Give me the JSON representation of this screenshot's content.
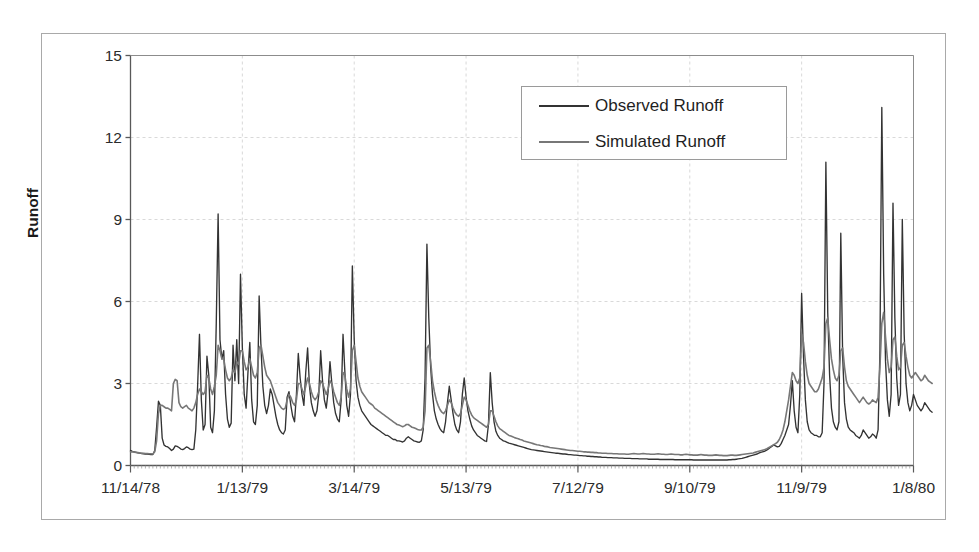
{
  "chart_data": {
    "type": "line",
    "title": "",
    "xlabel": "",
    "ylabel": "Runoff",
    "ylim": [
      0,
      15
    ],
    "yticks": [
      0,
      3,
      6,
      9,
      12,
      15
    ],
    "ytick_labels": [
      "0",
      "3",
      "6",
      "9",
      "12",
      "15"
    ],
    "xtick_labels": [
      "11/14/78",
      "1/13/79",
      "3/14/79",
      "5/13/79",
      "7/12/79",
      "9/10/79",
      "11/9/79",
      "1/8/80"
    ],
    "x_start_date": "11/14/78",
    "x_end_date": "1/8/80",
    "x_index_range": [
      0,
      420
    ],
    "xtick_indices": [
      0,
      60,
      120,
      180,
      240,
      300,
      360,
      420
    ],
    "grid": true,
    "grid_color": "#d9d9d9",
    "legend_position": "top-right",
    "legend": [
      "Observed Runoff",
      "Simulated Runoff"
    ],
    "series": [
      {
        "name": "Observed Runoff",
        "color": "#333333",
        "values": [
          0.55,
          0.52,
          0.5,
          0.48,
          0.46,
          0.45,
          0.44,
          0.43,
          0.42,
          0.42,
          0.41,
          0.4,
          0.4,
          0.55,
          1.4,
          2.35,
          2.2,
          1.0,
          0.75,
          0.7,
          0.68,
          0.62,
          0.55,
          0.6,
          0.72,
          0.7,
          0.66,
          0.6,
          0.58,
          0.62,
          0.68,
          0.65,
          0.6,
          0.58,
          0.6,
          1.3,
          2.9,
          4.8,
          2.4,
          1.3,
          1.5,
          4.0,
          3.3,
          1.4,
          1.2,
          2.0,
          5.2,
          9.2,
          4.6,
          3.9,
          4.2,
          2.6,
          1.7,
          1.4,
          1.55,
          4.4,
          3.1,
          4.6,
          3.0,
          7.0,
          4.3,
          2.6,
          2.1,
          3.4,
          4.5,
          2.4,
          1.6,
          1.5,
          2.2,
          6.2,
          4.3,
          2.9,
          2.2,
          1.9,
          2.2,
          2.8,
          2.6,
          2.2,
          1.8,
          1.5,
          1.3,
          1.2,
          1.15,
          1.3,
          2.5,
          2.7,
          2.2,
          1.8,
          1.6,
          2.6,
          4.1,
          3.2,
          2.6,
          2.2,
          3.4,
          4.3,
          2.9,
          2.3,
          2.0,
          1.8,
          2.0,
          2.6,
          4.2,
          3.1,
          2.4,
          2.1,
          2.7,
          3.8,
          3.0,
          2.3,
          1.9,
          1.7,
          1.6,
          2.4,
          4.8,
          3.4,
          2.2,
          1.8,
          2.6,
          7.3,
          4.6,
          3.1,
          2.5,
          2.2,
          2.0,
          1.9,
          1.8,
          1.7,
          1.6,
          1.5,
          1.45,
          1.4,
          1.35,
          1.3,
          1.25,
          1.2,
          1.15,
          1.1,
          1.1,
          1.05,
          1.0,
          0.95,
          0.95,
          0.9,
          0.9,
          0.88,
          0.86,
          0.9,
          1.0,
          1.05,
          1.0,
          0.95,
          0.9,
          0.88,
          0.86,
          0.85,
          0.9,
          1.3,
          3.2,
          8.1,
          5.4,
          3.6,
          2.6,
          2.0,
          1.7,
          1.5,
          1.35,
          1.25,
          1.2,
          1.6,
          2.3,
          2.9,
          2.4,
          1.9,
          1.5,
          1.3,
          1.2,
          1.6,
          2.6,
          3.2,
          2.5,
          2.0,
          1.7,
          1.45,
          1.3,
          1.2,
          1.1,
          1.05,
          1.0,
          0.95,
          0.9,
          0.88,
          1.5,
          3.4,
          2.3,
          1.6,
          1.25,
          1.1,
          1.0,
          0.95,
          0.9,
          0.88,
          0.85,
          0.82,
          0.8,
          0.78,
          0.76,
          0.74,
          0.72,
          0.7,
          0.68,
          0.66,
          0.64,
          0.62,
          0.6,
          0.58,
          0.57,
          0.56,
          0.55,
          0.54,
          0.53,
          0.52,
          0.51,
          0.5,
          0.49,
          0.48,
          0.47,
          0.46,
          0.45,
          0.45,
          0.44,
          0.43,
          0.42,
          0.42,
          0.41,
          0.4,
          0.4,
          0.39,
          0.38,
          0.38,
          0.37,
          0.36,
          0.36,
          0.35,
          0.35,
          0.34,
          0.34,
          0.33,
          0.33,
          0.32,
          0.32,
          0.31,
          0.31,
          0.3,
          0.3,
          0.3,
          0.29,
          0.29,
          0.29,
          0.28,
          0.28,
          0.28,
          0.27,
          0.27,
          0.27,
          0.26,
          0.26,
          0.26,
          0.26,
          0.25,
          0.25,
          0.25,
          0.25,
          0.24,
          0.24,
          0.24,
          0.24,
          0.24,
          0.23,
          0.23,
          0.23,
          0.23,
          0.23,
          0.23,
          0.22,
          0.22,
          0.22,
          0.22,
          0.22,
          0.22,
          0.22,
          0.22,
          0.21,
          0.21,
          0.21,
          0.21,
          0.21,
          0.21,
          0.21,
          0.21,
          0.21,
          0.21,
          0.2,
          0.2,
          0.2,
          0.2,
          0.2,
          0.2,
          0.2,
          0.2,
          0.2,
          0.2,
          0.2,
          0.2,
          0.2,
          0.2,
          0.2,
          0.2,
          0.2,
          0.2,
          0.2,
          0.21,
          0.21,
          0.22,
          0.22,
          0.23,
          0.24,
          0.25,
          0.26,
          0.28,
          0.3,
          0.32,
          0.34,
          0.36,
          0.38,
          0.4,
          0.42,
          0.45,
          0.48,
          0.5,
          0.52,
          0.55,
          0.6,
          0.65,
          0.7,
          0.75,
          0.72,
          0.68,
          0.7,
          0.8,
          0.95,
          1.1,
          1.3,
          1.5,
          2.2,
          3.1,
          2.0,
          1.4,
          1.2,
          2.6,
          6.3,
          4.0,
          2.4,
          1.6,
          1.3,
          1.2,
          1.15,
          1.1,
          1.1,
          1.05,
          1.05,
          1.2,
          3.0,
          11.1,
          5.6,
          3.3,
          2.1,
          1.6,
          1.4,
          1.3,
          1.6,
          8.5,
          4.0,
          2.3,
          1.7,
          1.4,
          1.3,
          1.25,
          1.2,
          1.1,
          1.05,
          1.0,
          1.1,
          1.3,
          1.2,
          1.1,
          1.0,
          1.05,
          1.15,
          1.1,
          1.0,
          1.3,
          4.2,
          13.1,
          7.0,
          3.8,
          2.4,
          1.8,
          2.6,
          9.6,
          5.4,
          3.2,
          2.2,
          2.6,
          9.0,
          4.8,
          3.0,
          2.3,
          2.0,
          2.2,
          2.6,
          2.4,
          2.2,
          2.1,
          2.0,
          2.1,
          2.3,
          2.2,
          2.1,
          2.0,
          1.95
        ]
      },
      {
        "name": "Simulated Runoff",
        "color": "#777777",
        "values": [
          0.5,
          0.5,
          0.49,
          0.48,
          0.47,
          0.46,
          0.45,
          0.45,
          0.44,
          0.44,
          0.43,
          0.43,
          0.42,
          0.5,
          0.9,
          1.9,
          2.2,
          2.2,
          2.15,
          2.1,
          2.1,
          2.05,
          2.0,
          3.0,
          3.15,
          3.1,
          2.3,
          2.15,
          2.1,
          2.15,
          2.2,
          2.1,
          2.05,
          2.0,
          2.1,
          2.3,
          2.6,
          2.8,
          2.7,
          2.6,
          2.7,
          3.3,
          3.2,
          2.8,
          2.6,
          2.9,
          3.3,
          4.4,
          4.2,
          3.9,
          3.9,
          3.5,
          3.2,
          3.1,
          3.2,
          3.5,
          3.4,
          3.8,
          3.7,
          4.2,
          4.2,
          3.8,
          3.5,
          3.6,
          3.9,
          3.6,
          3.3,
          3.2,
          3.4,
          4.3,
          4.4,
          4.0,
          3.6,
          3.3,
          3.2,
          3.1,
          2.9,
          2.7,
          2.5,
          2.3,
          2.2,
          2.1,
          2.05,
          2.1,
          2.4,
          2.6,
          2.5,
          2.3,
          2.2,
          2.4,
          3.0,
          3.0,
          2.8,
          2.6,
          2.9,
          3.2,
          3.0,
          2.7,
          2.5,
          2.4,
          2.5,
          2.7,
          3.1,
          3.0,
          2.8,
          2.6,
          2.8,
          3.1,
          3.0,
          2.7,
          2.5,
          2.3,
          2.2,
          2.5,
          3.4,
          3.3,
          2.8,
          2.5,
          2.8,
          4.2,
          4.4,
          3.8,
          3.2,
          2.9,
          2.7,
          2.6,
          2.5,
          2.4,
          2.3,
          2.25,
          2.2,
          2.1,
          2.05,
          2.0,
          1.95,
          1.9,
          1.85,
          1.8,
          1.75,
          1.7,
          1.65,
          1.6,
          1.55,
          1.5,
          1.48,
          1.45,
          1.42,
          1.45,
          1.5,
          1.5,
          1.45,
          1.4,
          1.38,
          1.35,
          1.32,
          1.3,
          1.3,
          1.4,
          2.0,
          4.3,
          4.4,
          3.8,
          3.1,
          2.7,
          2.4,
          2.2,
          2.05,
          1.95,
          1.9,
          2.0,
          2.2,
          2.4,
          2.3,
          2.1,
          1.95,
          1.85,
          1.8,
          1.9,
          2.2,
          2.5,
          2.4,
          2.2,
          2.0,
          1.85,
          1.75,
          1.7,
          1.65,
          1.6,
          1.55,
          1.5,
          1.45,
          1.4,
          1.5,
          2.0,
          2.0,
          1.8,
          1.6,
          1.45,
          1.35,
          1.3,
          1.25,
          1.2,
          1.15,
          1.1,
          1.08,
          1.05,
          1.02,
          1.0,
          0.98,
          0.95,
          0.93,
          0.9,
          0.88,
          0.86,
          0.84,
          0.82,
          0.8,
          0.78,
          0.76,
          0.75,
          0.73,
          0.72,
          0.7,
          0.69,
          0.68,
          0.66,
          0.65,
          0.64,
          0.63,
          0.62,
          0.61,
          0.6,
          0.59,
          0.58,
          0.57,
          0.56,
          0.55,
          0.55,
          0.54,
          0.53,
          0.52,
          0.52,
          0.51,
          0.5,
          0.5,
          0.49,
          0.49,
          0.48,
          0.48,
          0.47,
          0.47,
          0.46,
          0.46,
          0.45,
          0.45,
          0.45,
          0.44,
          0.44,
          0.44,
          0.43,
          0.43,
          0.43,
          0.42,
          0.42,
          0.42,
          0.42,
          0.41,
          0.41,
          0.42,
          0.43,
          0.44,
          0.43,
          0.42,
          0.42,
          0.43,
          0.44,
          0.43,
          0.42,
          0.42,
          0.41,
          0.41,
          0.41,
          0.42,
          0.43,
          0.42,
          0.41,
          0.41,
          0.4,
          0.4,
          0.41,
          0.42,
          0.41,
          0.4,
          0.4,
          0.4,
          0.39,
          0.39,
          0.4,
          0.41,
          0.4,
          0.39,
          0.39,
          0.38,
          0.38,
          0.38,
          0.39,
          0.4,
          0.39,
          0.38,
          0.38,
          0.37,
          0.37,
          0.37,
          0.38,
          0.39,
          0.38,
          0.37,
          0.37,
          0.36,
          0.36,
          0.36,
          0.37,
          0.38,
          0.38,
          0.37,
          0.37,
          0.38,
          0.39,
          0.4,
          0.41,
          0.42,
          0.43,
          0.44,
          0.45,
          0.46,
          0.48,
          0.5,
          0.52,
          0.54,
          0.56,
          0.58,
          0.6,
          0.64,
          0.68,
          0.72,
          0.76,
          0.8,
          0.85,
          0.95,
          1.1,
          1.3,
          1.6,
          2.0,
          2.4,
          2.9,
          3.4,
          3.3,
          3.1,
          3.0,
          3.2,
          4.8,
          4.5,
          3.8,
          3.3,
          3.0,
          2.9,
          2.8,
          2.7,
          2.7,
          2.8,
          3.0,
          3.2,
          3.6,
          5.2,
          5.4,
          4.6,
          3.9,
          3.5,
          3.2,
          3.1,
          3.3,
          4.2,
          4.3,
          3.6,
          3.1,
          2.9,
          2.8,
          2.7,
          2.6,
          2.5,
          2.4,
          2.3,
          2.4,
          2.5,
          2.4,
          2.3,
          2.25,
          2.3,
          2.4,
          2.35,
          2.3,
          2.5,
          3.6,
          5.2,
          5.6,
          4.7,
          3.9,
          3.4,
          3.6,
          4.6,
          4.7,
          4.0,
          3.5,
          3.6,
          4.4,
          4.5,
          4.0,
          3.6,
          3.3,
          3.2,
          3.3,
          3.4,
          3.3,
          3.2,
          3.1,
          3.15,
          3.3,
          3.2,
          3.1,
          3.05,
          3.0
        ]
      }
    ]
  },
  "axes": {
    "y_title": "Runoff"
  }
}
